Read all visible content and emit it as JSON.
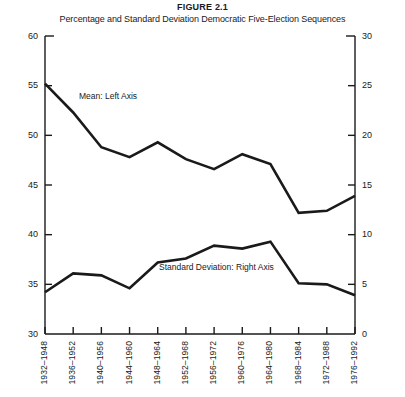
{
  "figure": {
    "number": "FIGURE 2.1",
    "subtitle": "Percentage and Standard Deviation Democratic Five-Election Sequences"
  },
  "chart_data": {
    "type": "line",
    "title": "Percentage and Standard Deviation Democratic Five-Election Sequences",
    "xlabel": "",
    "ylabel": "",
    "grid": false,
    "legend_position": "inline-annotation",
    "categories": [
      "1932–1948",
      "1936–1952",
      "1940–1956",
      "1944–1960",
      "1948–1964",
      "1952–1968",
      "1956–1972",
      "1960–1976",
      "1964–1980",
      "1968–1984",
      "1972–1988",
      "1976–1992"
    ],
    "axes": {
      "left": {
        "label": "Mean: Left Axis",
        "min": 30,
        "max": 60,
        "step": 5,
        "ticks": [
          30,
          35,
          40,
          45,
          50,
          55,
          60
        ]
      },
      "right": {
        "label": "Standard Deviation: Right Axis",
        "min": 0,
        "max": 30,
        "step": 5,
        "ticks": [
          0,
          5,
          10,
          15,
          20,
          25,
          30
        ]
      }
    },
    "series": [
      {
        "name": "Mean: Left Axis",
        "axis": "left",
        "values": [
          55.2,
          52.3,
          48.8,
          47.8,
          49.3,
          47.6,
          46.6,
          48.1,
          47.1,
          42.2,
          42.4,
          43.9
        ]
      },
      {
        "name": "Standard Deviation: Right Axis",
        "axis": "right",
        "values": [
          4.2,
          6.1,
          5.9,
          4.6,
          7.2,
          7.6,
          8.9,
          8.6,
          9.3,
          5.1,
          5.0,
          3.9
        ]
      }
    ],
    "annotations": [
      {
        "text": "Mean: Left Axis",
        "x_category": "1936–1952",
        "value": 52.3
      },
      {
        "text": "Standard Deviation: Right Axis",
        "x_category": "1956–1972",
        "value": 8.9
      }
    ]
  }
}
